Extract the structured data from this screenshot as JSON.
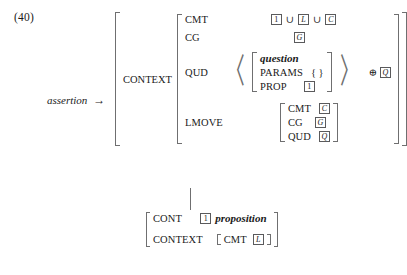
{
  "example": {
    "number": "(40)",
    "left_label": "assertion",
    "arrow": "→"
  },
  "outer": {
    "context_label": "CONTEXT",
    "cmt": {
      "feature": "CMT",
      "tag1": "1",
      "op1": "∪",
      "tag2": "L",
      "op2": "∪",
      "tag3": "C"
    },
    "cg": {
      "feature": "CG",
      "tag": "G"
    },
    "qud": {
      "feature": "QUD",
      "type": "question",
      "params_feature": "PARAMS",
      "params_value": "{ }",
      "prop_feature": "PROP",
      "prop_tag": "1",
      "append_op": "⊕",
      "append_tag": "Q"
    },
    "lmove": {
      "feature": "LMOVE",
      "rows": [
        {
          "feature": "CMT",
          "tag": "C"
        },
        {
          "feature": "CG",
          "tag": "G"
        },
        {
          "feature": "QUD",
          "tag": "Q"
        }
      ]
    }
  },
  "bottom": {
    "cont": {
      "feature": "CONT",
      "tag": "1",
      "type": "proposition"
    },
    "context": {
      "feature": "CONTEXT",
      "inner_feature": "CMT",
      "inner_tag": "L"
    }
  }
}
